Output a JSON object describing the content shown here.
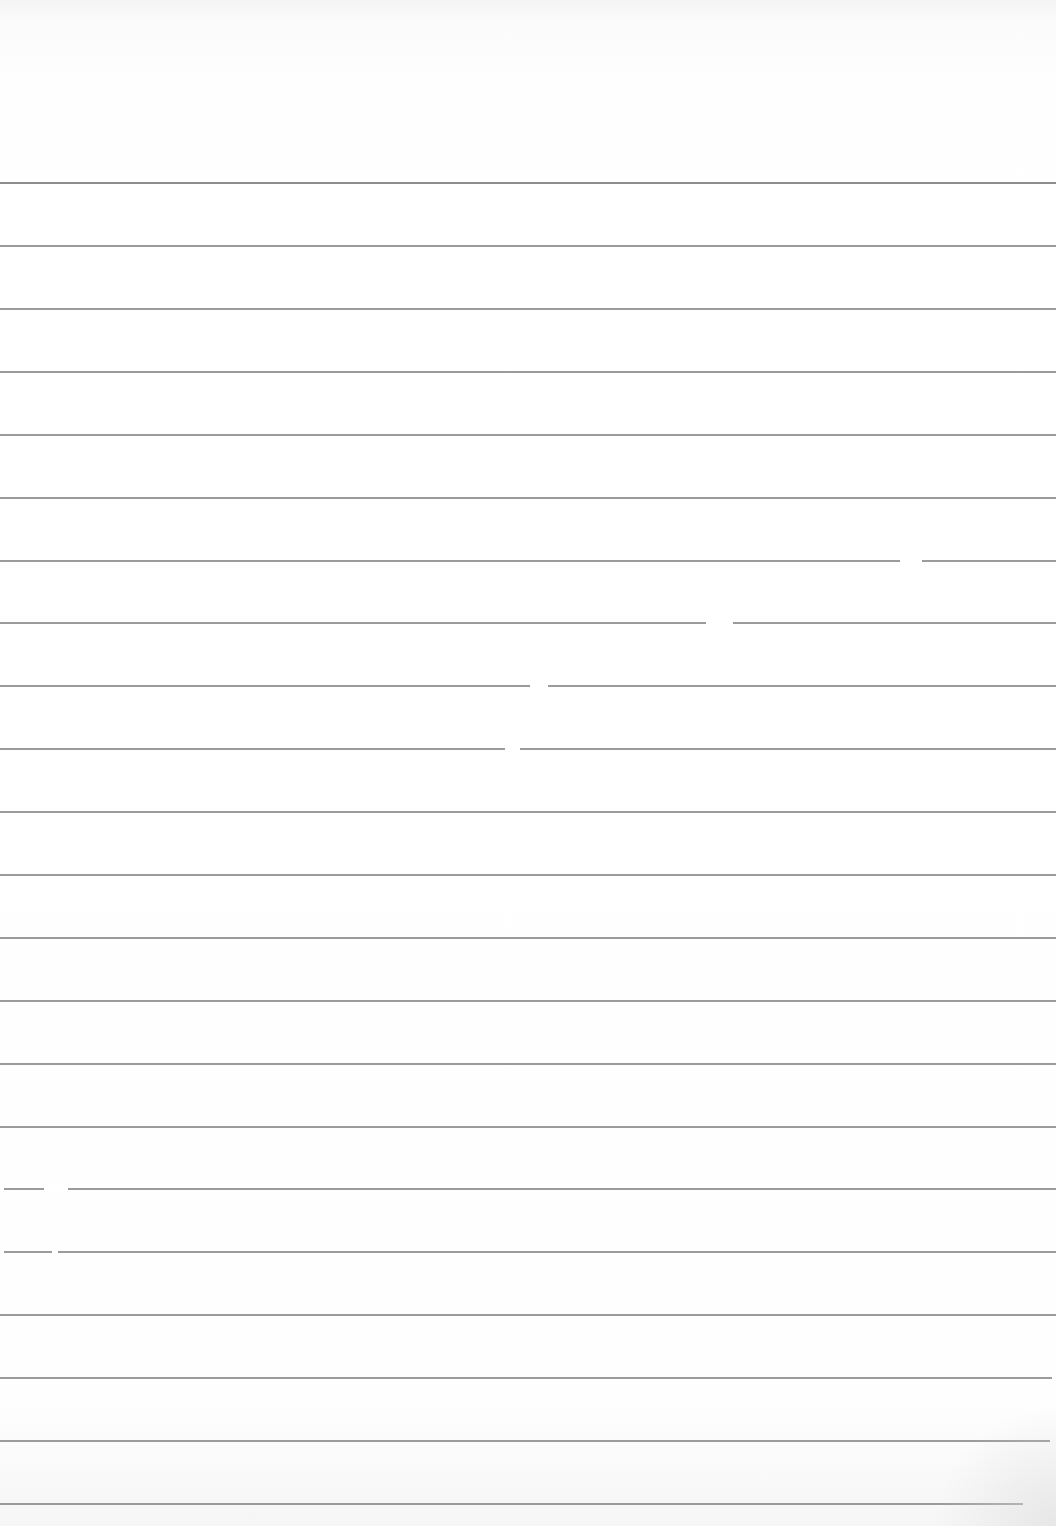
{
  "document": {
    "type": "ruled-paper",
    "text": "",
    "line_count": 22,
    "first_line_y": 182,
    "line_spacing": 62.9,
    "line_color": "#8a8a8a",
    "paper_color": "#ffffff",
    "lines": [
      {
        "y": 182,
        "x1": 0,
        "x2": 1056,
        "heavy": true
      },
      {
        "y": 245,
        "x1": 0,
        "x2": 1056
      },
      {
        "y": 308,
        "x1": 0,
        "x2": 1056
      },
      {
        "y": 371,
        "x1": 0,
        "x2": 1056
      },
      {
        "y": 434,
        "x1": 0,
        "x2": 1056
      },
      {
        "y": 497,
        "x1": 0,
        "x2": 1056
      },
      {
        "y": 560,
        "x1": 0,
        "x2": 1056,
        "gap": [
          900,
          922
        ]
      },
      {
        "y": 622,
        "x1": 0,
        "x2": 1056,
        "gap": [
          706,
          733
        ]
      },
      {
        "y": 685,
        "x1": 0,
        "x2": 1056,
        "gap": [
          530,
          548
        ]
      },
      {
        "y": 748,
        "x1": 0,
        "x2": 1056,
        "gap": [
          505,
          520
        ]
      },
      {
        "y": 811,
        "x1": 0,
        "x2": 1056
      },
      {
        "y": 874,
        "x1": 0,
        "x2": 1056
      },
      {
        "y": 937,
        "x1": 0,
        "x2": 1056
      },
      {
        "y": 1000,
        "x1": 0,
        "x2": 1056
      },
      {
        "y": 1063,
        "x1": 0,
        "x2": 1056
      },
      {
        "y": 1126,
        "x1": 0,
        "x2": 1056
      },
      {
        "y": 1188,
        "x1": 4,
        "x2": 1056,
        "gap": [
          44,
          68
        ]
      },
      {
        "y": 1251,
        "x1": 4,
        "x2": 1056,
        "gap": [
          52,
          58
        ]
      },
      {
        "y": 1314,
        "x1": 0,
        "x2": 1056
      },
      {
        "y": 1377,
        "x1": 0,
        "x2": 1052
      },
      {
        "y": 1440,
        "x1": 0,
        "x2": 1050
      },
      {
        "y": 1503,
        "x1": 0,
        "x2": 1023
      }
    ]
  }
}
